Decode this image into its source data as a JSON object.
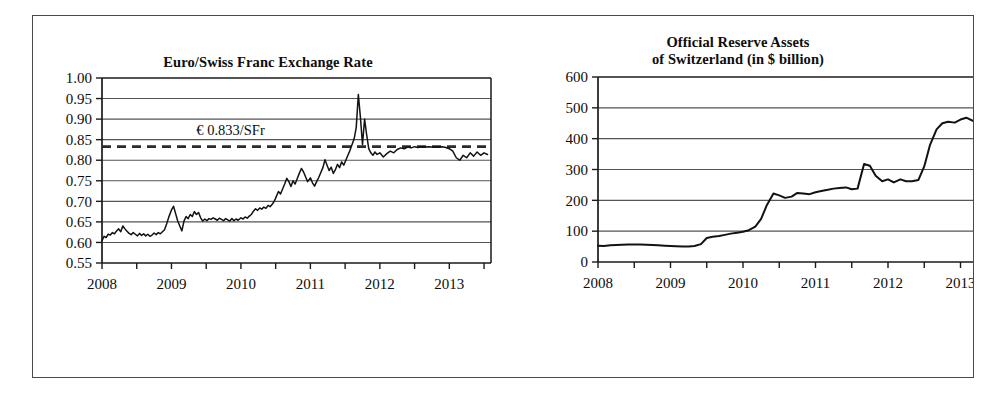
{
  "figure": {
    "background_color": "#ffffff",
    "frame_color": "#4a4a4a",
    "line_color": "#121212",
    "grid_color": "#555555"
  },
  "chart_data": [
    {
      "id": "euro-swiss-franc-exchange-rate",
      "type": "line",
      "title": "Euro/Swiss Franc Exchange Rate",
      "xlabel": "",
      "ylabel": "",
      "xlim": [
        2008.0,
        2013.6
      ],
      "ylim": [
        0.55,
        1.0
      ],
      "grid": true,
      "legend": "none",
      "y_ticks": [
        0.55,
        0.6,
        0.65,
        0.7,
        0.75,
        0.8,
        0.85,
        0.9,
        0.95,
        1.0
      ],
      "y_tick_labels": [
        "0.55",
        "0.60",
        "0.65",
        "0.70",
        "0.75",
        "0.80",
        "0.85",
        "0.90",
        "0.95",
        "1.00"
      ],
      "x_ticks": [
        2008,
        2008.5,
        2009,
        2009.5,
        2010,
        2010.5,
        2011,
        2011.5,
        2012,
        2012.5,
        2013,
        2013.5
      ],
      "x_tick_labels": [
        {
          "value": 2008,
          "label": "2008"
        },
        {
          "value": 2009,
          "label": "2009"
        },
        {
          "value": 2010,
          "label": "2010"
        },
        {
          "value": 2011,
          "label": "2011"
        },
        {
          "value": 2012,
          "label": "2012"
        },
        {
          "value": 2013,
          "label": "2013"
        }
      ],
      "annotations": [
        {
          "name": "euro-peg-reference",
          "text": "€ 0.833/SFr",
          "y": 0.833,
          "label_x": 2009.85,
          "label_y": 0.862,
          "style": "dashed-horizontal-line"
        }
      ],
      "series": [
        {
          "name": "EUR per SFr",
          "x": [
            2008.0,
            2008.03,
            2008.06,
            2008.09,
            2008.12,
            2008.15,
            2008.18,
            2008.21,
            2008.24,
            2008.27,
            2008.3,
            2008.33,
            2008.36,
            2008.39,
            2008.42,
            2008.45,
            2008.48,
            2008.51,
            2008.54,
            2008.57,
            2008.6,
            2008.63,
            2008.66,
            2008.69,
            2008.72,
            2008.75,
            2008.78,
            2008.81,
            2008.84,
            2008.87,
            2008.9,
            2008.93,
            2008.96,
            2009.0,
            2009.03,
            2009.06,
            2009.09,
            2009.12,
            2009.15,
            2009.18,
            2009.21,
            2009.24,
            2009.27,
            2009.3,
            2009.33,
            2009.36,
            2009.39,
            2009.42,
            2009.45,
            2009.48,
            2009.51,
            2009.54,
            2009.57,
            2009.6,
            2009.63,
            2009.66,
            2009.69,
            2009.72,
            2009.75,
            2009.78,
            2009.81,
            2009.84,
            2009.87,
            2009.9,
            2009.93,
            2009.96,
            2010.0,
            2010.03,
            2010.06,
            2010.09,
            2010.12,
            2010.15,
            2010.18,
            2010.21,
            2010.24,
            2010.27,
            2010.3,
            2010.33,
            2010.36,
            2010.39,
            2010.42,
            2010.45,
            2010.48,
            2010.51,
            2010.54,
            2010.57,
            2010.6,
            2010.63,
            2010.66,
            2010.69,
            2010.72,
            2010.75,
            2010.78,
            2010.81,
            2010.84,
            2010.87,
            2010.9,
            2010.93,
            2010.96,
            2011.0,
            2011.03,
            2011.06,
            2011.09,
            2011.12,
            2011.15,
            2011.18,
            2011.21,
            2011.24,
            2011.27,
            2011.3,
            2011.33,
            2011.36,
            2011.39,
            2011.42,
            2011.45,
            2011.48,
            2011.51,
            2011.54,
            2011.57,
            2011.6,
            2011.63,
            2011.66,
            2011.69,
            2011.72,
            2011.75,
            2011.78,
            2011.81,
            2011.84,
            2011.87,
            2011.9,
            2011.93,
            2011.96,
            2012.0,
            2012.05,
            2012.1,
            2012.15,
            2012.2,
            2012.25,
            2012.3,
            2012.35,
            2012.4,
            2012.45,
            2012.5,
            2012.55,
            2012.6,
            2012.65,
            2012.7,
            2012.75,
            2012.8,
            2012.85,
            2012.9,
            2012.95,
            2013.0,
            2013.05,
            2013.1,
            2013.15,
            2013.2,
            2013.25,
            2013.3,
            2013.35,
            2013.4,
            2013.45,
            2013.5,
            2013.55
          ],
          "y": [
            0.604,
            0.615,
            0.612,
            0.62,
            0.618,
            0.624,
            0.621,
            0.628,
            0.633,
            0.626,
            0.64,
            0.633,
            0.627,
            0.622,
            0.619,
            0.624,
            0.62,
            0.616,
            0.622,
            0.617,
            0.621,
            0.616,
            0.62,
            0.615,
            0.618,
            0.623,
            0.619,
            0.624,
            0.621,
            0.626,
            0.631,
            0.645,
            0.661,
            0.679,
            0.688,
            0.67,
            0.652,
            0.64,
            0.628,
            0.652,
            0.663,
            0.658,
            0.668,
            0.663,
            0.675,
            0.668,
            0.673,
            0.66,
            0.652,
            0.657,
            0.653,
            0.658,
            0.656,
            0.66,
            0.657,
            0.654,
            0.659,
            0.656,
            0.653,
            0.658,
            0.655,
            0.652,
            0.658,
            0.653,
            0.657,
            0.654,
            0.66,
            0.657,
            0.662,
            0.659,
            0.664,
            0.668,
            0.676,
            0.682,
            0.678,
            0.684,
            0.681,
            0.686,
            0.683,
            0.69,
            0.687,
            0.693,
            0.7,
            0.712,
            0.724,
            0.718,
            0.73,
            0.742,
            0.756,
            0.748,
            0.736,
            0.75,
            0.742,
            0.755,
            0.768,
            0.78,
            0.772,
            0.76,
            0.748,
            0.757,
            0.745,
            0.737,
            0.748,
            0.758,
            0.77,
            0.782,
            0.801,
            0.788,
            0.775,
            0.783,
            0.768,
            0.777,
            0.79,
            0.782,
            0.796,
            0.788,
            0.8,
            0.812,
            0.824,
            0.838,
            0.852,
            0.88,
            0.96,
            0.905,
            0.838,
            0.9,
            0.862,
            0.828,
            0.818,
            0.812,
            0.82,
            0.814,
            0.818,
            0.808,
            0.816,
            0.822,
            0.818,
            0.826,
            0.83,
            0.828,
            0.832,
            0.83,
            0.833,
            0.831,
            0.833,
            0.832,
            0.833,
            0.832,
            0.833,
            0.832,
            0.833,
            0.831,
            0.828,
            0.822,
            0.806,
            0.8,
            0.812,
            0.806,
            0.818,
            0.81,
            0.82,
            0.812,
            0.818,
            0.814
          ]
        }
      ]
    },
    {
      "id": "official-reserve-assets-of-switzerland",
      "type": "line",
      "title": "Official Reserve Assets\nof Switzerland (in $ billion)",
      "title_line1": "Official Reserve Assets",
      "title_line2": "of Switzerland (in $ billion)",
      "xlabel": "",
      "ylabel": "",
      "xlim": [
        2008.0,
        2013.2
      ],
      "ylim": [
        0,
        600
      ],
      "grid": true,
      "legend": "none",
      "y_ticks": [
        0,
        100,
        200,
        300,
        400,
        500,
        600
      ],
      "y_tick_labels": [
        "0",
        "100",
        "200",
        "300",
        "400",
        "500",
        "600"
      ],
      "x_ticks": [
        2008,
        2008.5,
        2009,
        2009.5,
        2010,
        2010.5,
        2011,
        2011.5,
        2012,
        2012.5,
        2013
      ],
      "x_tick_labels": [
        {
          "value": 2008,
          "label": "2008"
        },
        {
          "value": 2009,
          "label": "2009"
        },
        {
          "value": 2010,
          "label": "2010"
        },
        {
          "value": 2011,
          "label": "2011"
        },
        {
          "value": 2012,
          "label": "2012"
        },
        {
          "value": 2013,
          "label": "2013"
        }
      ],
      "annotations": [],
      "series": [
        {
          "name": "Official reserve assets ($ billion)",
          "x": [
            2008.0,
            2008.08,
            2008.17,
            2008.25,
            2008.33,
            2008.42,
            2008.5,
            2008.58,
            2008.67,
            2008.75,
            2008.83,
            2008.92,
            2009.0,
            2009.08,
            2009.17,
            2009.25,
            2009.33,
            2009.42,
            2009.5,
            2009.58,
            2009.67,
            2009.75,
            2009.83,
            2009.92,
            2010.0,
            2010.08,
            2010.17,
            2010.25,
            2010.33,
            2010.42,
            2010.5,
            2010.58,
            2010.67,
            2010.75,
            2010.83,
            2010.92,
            2011.0,
            2011.08,
            2011.17,
            2011.25,
            2011.33,
            2011.42,
            2011.5,
            2011.58,
            2011.67,
            2011.75,
            2011.83,
            2011.92,
            2012.0,
            2012.08,
            2012.17,
            2012.25,
            2012.33,
            2012.42,
            2012.5,
            2012.58,
            2012.67,
            2012.75,
            2012.83,
            2012.92,
            2013.0,
            2013.08,
            2013.17
          ],
          "y": [
            53,
            52,
            54,
            55,
            56,
            57,
            57,
            57,
            56,
            55,
            54,
            53,
            52,
            51,
            50,
            50,
            52,
            58,
            78,
            82,
            84,
            88,
            92,
            95,
            98,
            103,
            115,
            140,
            185,
            222,
            216,
            208,
            212,
            224,
            222,
            220,
            226,
            230,
            234,
            238,
            240,
            242,
            236,
            238,
            318,
            312,
            280,
            262,
            268,
            258,
            268,
            262,
            262,
            266,
            310,
            380,
            430,
            450,
            455,
            452,
            462,
            468,
            458
          ]
        }
      ]
    }
  ],
  "panels": {
    "left": {
      "title": "Euro/Swiss Franc Exchange Rate",
      "annotation_text": "€ 0.833/SFr"
    },
    "right": {
      "title_line1": "Official Reserve Assets",
      "title_line2": "of Switzerland (in $ billion)"
    }
  }
}
